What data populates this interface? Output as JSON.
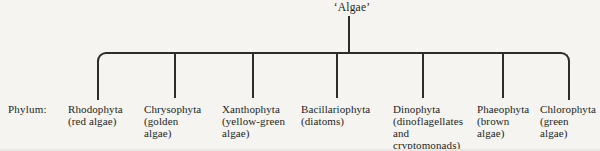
{
  "root": {
    "label": "‘Algae’"
  },
  "row_label": "Phylum:",
  "colors": {
    "line": "#2e2c28",
    "text": "#211f1c",
    "background": "#f5f4f0"
  },
  "phyla": [
    {
      "name": "Rhodophyta",
      "common_lines": [
        "(red algae)"
      ]
    },
    {
      "name": "Chrysophyta",
      "common_lines": [
        "(golden",
        "algae)"
      ]
    },
    {
      "name": "Xanthophyta",
      "common_lines": [
        "(yellow-green",
        "algae)"
      ]
    },
    {
      "name": "Bacillariophyta",
      "common_lines": [
        "(diatoms)"
      ]
    },
    {
      "name": "Dinophyta",
      "common_lines": [
        "(dinoflagellates",
        "and",
        "cryptomonads)"
      ]
    },
    {
      "name": "Phaeophyta",
      "common_lines": [
        "(brown",
        "algae)"
      ]
    },
    {
      "name": "Chlorophyta",
      "common_lines": [
        "(green",
        "algae)"
      ]
    }
  ]
}
